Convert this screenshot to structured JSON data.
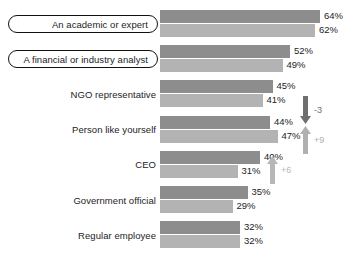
{
  "chart_data": {
    "type": "bar",
    "orientation": "horizontal",
    "title": "",
    "subtitle": "",
    "xlabel": "",
    "ylabel": "",
    "xlim": [
      0,
      70
    ],
    "grid": false,
    "legend_position": "none",
    "value_suffix": "%",
    "categories": [
      "An academic or expert",
      "A financial or industry analyst",
      "NGO representative",
      "Person like yourself",
      "CEO",
      "Government official",
      "Regular employee"
    ],
    "series": [
      {
        "name": "series-1",
        "color": "#8d8d8d",
        "values": [
          64,
          52,
          45,
          44,
          40,
          35,
          32
        ],
        "labels": [
          "64%",
          "52%",
          "45%",
          "44%",
          "40%",
          "35%",
          "32%"
        ]
      },
      {
        "name": "series-2",
        "color": "#b3b3b3",
        "values": [
          62,
          49,
          41,
          47,
          31,
          29,
          32
        ],
        "labels": [
          "62%",
          "49%",
          "41%",
          "47%",
          "31%",
          "29%",
          "32%"
        ]
      }
    ],
    "highlighted_categories": [
      "An academic or expert",
      "A financial or industry analyst"
    ],
    "annotations": [
      {
        "name": "change-person-like-yourself-series1",
        "label": "-3",
        "direction": "down",
        "color": "#6f6f6f",
        "value": -3
      },
      {
        "name": "change-person-like-yourself-series2",
        "label": "+9",
        "direction": "up",
        "color": "#b0b0b0",
        "value": 9
      },
      {
        "name": "change-ceo-series2",
        "label": "+6",
        "direction": "up",
        "color": "#b7b7b7",
        "value": 6
      }
    ]
  },
  "colors": {
    "background": "#ffffff",
    "series_1": "#8d8d8d",
    "series_2": "#b3b3b3",
    "text": "#1d1d1d",
    "box_border": "#111111",
    "arrow_down": "#6f6f6f",
    "arrow_up": "#b0b0b0"
  }
}
